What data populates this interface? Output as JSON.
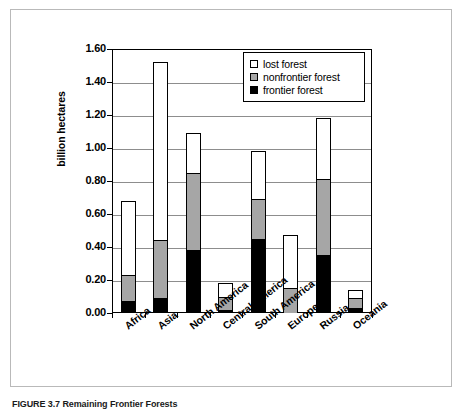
{
  "caption": "FIGURE 3.7 Remaining Frontier Forests",
  "chart_data": {
    "type": "bar",
    "subtype": "stacked-vertical",
    "title": "",
    "xlabel": "",
    "ylabel": "billion hectares",
    "ylim": [
      0.0,
      1.6
    ],
    "ytick_labels": [
      "1.60",
      "1.40",
      "1.20",
      "1.00",
      "0.80",
      "0.60",
      "0.40",
      "0.20",
      "0.00"
    ],
    "ytick_values": [
      1.6,
      1.4,
      1.2,
      1.0,
      0.8,
      0.6,
      0.4,
      0.2,
      0.0
    ],
    "grid": true,
    "legend_position": "top-right",
    "categories": [
      "Africa",
      "Asia",
      "North America",
      "Central America",
      "South America",
      "Europe",
      "Russia",
      "Oceania"
    ],
    "series": [
      {
        "name": "frontier forest",
        "color": "#000000",
        "values": [
          0.07,
          0.09,
          0.38,
          0.02,
          0.45,
          0.0,
          0.35,
          0.03
        ]
      },
      {
        "name": "nonfrontier forest",
        "color": "#a6a6a6",
        "values": [
          0.16,
          0.35,
          0.47,
          0.08,
          0.24,
          0.15,
          0.46,
          0.06
        ]
      },
      {
        "name": "lost forest",
        "color": "#ffffff",
        "values": [
          0.45,
          1.08,
          0.24,
          0.08,
          0.29,
          0.32,
          0.37,
          0.05
        ]
      }
    ],
    "totals": [
      0.68,
      1.52,
      1.09,
      0.18,
      0.98,
      0.47,
      1.18,
      0.14
    ]
  },
  "legend": {
    "items": [
      {
        "label": "lost forest",
        "swatch": "white"
      },
      {
        "label": "nonfrontier forest",
        "swatch": "gray"
      },
      {
        "label": "frontier forest",
        "swatch": "black"
      }
    ]
  },
  "colors": {
    "frontier": "#000000",
    "nonfrontier": "#a6a6a6",
    "lost": "#ffffff",
    "axis": "#000000",
    "grid": "#8d8d8d",
    "frame": "#b9b9b9"
  }
}
